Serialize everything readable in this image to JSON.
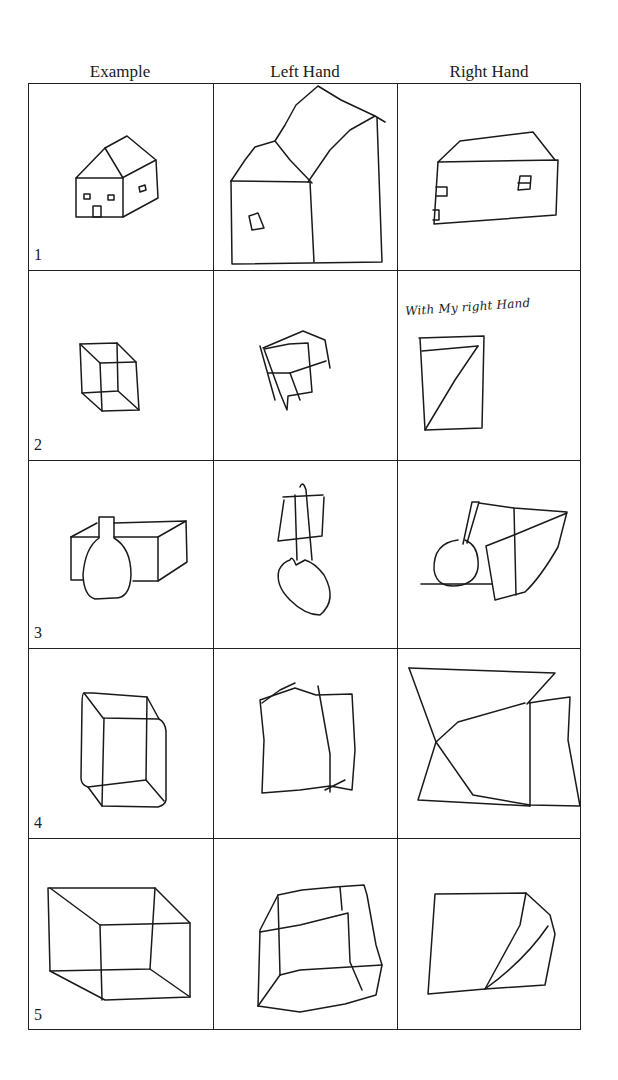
{
  "figure": {
    "columns": [
      "Example",
      "Left Hand",
      "Right Hand"
    ],
    "rows": [
      {
        "number": "1",
        "subject": "house",
        "example": "house",
        "left_hand": "house drawing",
        "right_hand": "house drawing"
      },
      {
        "number": "2",
        "subject": "cube",
        "example": "wireframe cube",
        "left_hand": "cube drawing",
        "right_hand": "rectangle with diagonal"
      },
      {
        "number": "3",
        "subject": "vase and box",
        "example": "vase in front of box",
        "left_hand": "vase and box drawing",
        "right_hand": "vase and box drawing"
      },
      {
        "number": "4",
        "subject": "rounded box",
        "example": "rounded rectangular box",
        "left_hand": "box drawing",
        "right_hand": "box drawing"
      },
      {
        "number": "5",
        "subject": "open box",
        "example": "box viewed from inside",
        "left_hand": "box drawing",
        "right_hand": "folded shape drawing"
      }
    ],
    "handwritten_note": "With My right Hand"
  }
}
